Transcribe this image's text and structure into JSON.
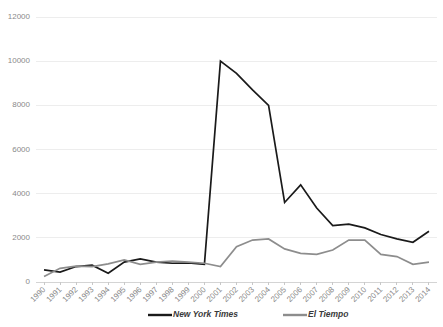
{
  "chart_data": {
    "type": "line",
    "title": "",
    "xlabel": "",
    "ylabel": "",
    "ylim": [
      0,
      12000
    ],
    "yticks": [
      0,
      2000,
      4000,
      6000,
      8000,
      10000,
      12000
    ],
    "ytick_labels": [
      "0",
      "2000",
      "4000",
      "6000",
      "8000",
      "10000",
      "12000"
    ],
    "grid": true,
    "legend_position": "bottom",
    "categories": [
      "1990",
      "1991",
      "1992",
      "1993",
      "1994",
      "1995",
      "1996",
      "1997",
      "1998",
      "1999",
      "2000",
      "2001",
      "2002",
      "2003",
      "2004",
      "2005",
      "2006",
      "2007",
      "2008",
      "2009",
      "2010",
      "2011",
      "2012",
      "2013",
      "2014"
    ],
    "series": [
      {
        "name": "New York Times",
        "color": "#1a1a1a",
        "values": [
          550,
          450,
          700,
          760,
          400,
          900,
          1050,
          900,
          850,
          860,
          800,
          10000,
          9450,
          8700,
          8000,
          3600,
          4400,
          3350,
          2550,
          2620,
          2450,
          2150,
          1950,
          1800,
          2300
        ]
      },
      {
        "name": "El Tiempo",
        "color": "#8d8d8d",
        "values": [
          250,
          620,
          720,
          700,
          820,
          1000,
          800,
          900,
          950,
          900,
          850,
          700,
          1600,
          1900,
          1950,
          1500,
          1300,
          1250,
          1450,
          1900,
          1900,
          1250,
          1150,
          800,
          900
        ]
      }
    ]
  },
  "legend": {
    "items": [
      {
        "label": "New York Times",
        "color": "#1a1a1a"
      },
      {
        "label": "El Tiempo",
        "color": "#8d8d8d"
      }
    ]
  }
}
